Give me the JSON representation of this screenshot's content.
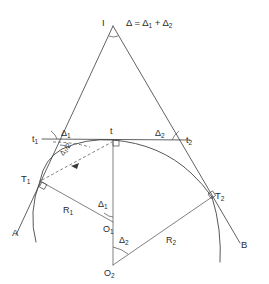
{
  "figure": {
    "title_equation": "Δ = Δ",
    "equation_full": "Δ = Δ1 + Δ2",
    "background_color": "#ffffff",
    "line_color": "#3a3a3a",
    "text_color": "#2b2b2b"
  },
  "equation": {
    "lhs": "Δ",
    "eq": "=",
    "term1_base": "Δ",
    "term1_sub": "1",
    "plus": "+",
    "term2_base": "Δ",
    "term2_sub": "2"
  },
  "labels": {
    "apex": "I",
    "tangent_left": {
      "base": "t",
      "sub": "1"
    },
    "tangent_mid": {
      "base": "t",
      "sub": ""
    },
    "tangent_right": {
      "base": "t",
      "sub": "2"
    },
    "delta1_top": {
      "base": "Δ",
      "sub": "1"
    },
    "delta2_top": {
      "base": "Δ",
      "sub": "2"
    },
    "half_delta1": {
      "base": "Δ",
      "sub": "1",
      "over": "/2"
    },
    "point_T1": {
      "base": "T",
      "sub": "1"
    },
    "point_T2": {
      "base": "T",
      "sub": "2"
    },
    "radius_R1": {
      "base": "R",
      "sub": "1"
    },
    "radius_R2": {
      "base": "R",
      "sub": "2"
    },
    "center_O1": {
      "base": "O",
      "sub": "1"
    },
    "center_O2": {
      "base": "O",
      "sub": "2"
    },
    "delta1_center": {
      "base": "Δ",
      "sub": "1"
    },
    "delta2_center": {
      "base": "Δ",
      "sub": "2"
    },
    "back_tangent_end": "A",
    "forward_tangent_end": "B"
  },
  "geometry": {
    "apex_point": [
      113,
      26
    ],
    "tangent_point_t": [
      113,
      140
    ],
    "point_t1": [
      45,
      139
    ],
    "point_t2": [
      183,
      140
    ],
    "point_T1": [
      40,
      181
    ],
    "point_T2": [
      212,
      197
    ],
    "center_O1": [
      113,
      222
    ],
    "center_O2": [
      113,
      265
    ],
    "curve_type": "compound-circular-curve"
  }
}
